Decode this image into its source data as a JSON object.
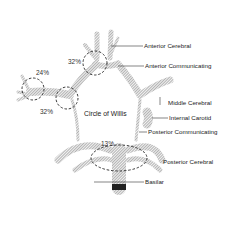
{
  "diagram": {
    "title": "Circle of Willis",
    "labels": [
      {
        "id": "anterior-cerebral",
        "text": "Anterior Cerebral"
      },
      {
        "id": "anterior-communicating",
        "text": "Anterior Communicating"
      },
      {
        "id": "middle-cerebral",
        "text": "Middle Cerebral"
      },
      {
        "id": "internal-carotid",
        "text": "Internal Carotid"
      },
      {
        "id": "posterior-communicating",
        "text": "Posterior Communicating"
      },
      {
        "id": "posterior-cerebral",
        "text": "Posterior Cerebral"
      },
      {
        "id": "basilar",
        "text": "Basilar"
      }
    ],
    "percentages": [
      {
        "id": "pct-anterior",
        "text": "32%"
      },
      {
        "id": "pct-middle-cerebral",
        "text": "24%"
      },
      {
        "id": "pct-carotid",
        "text": "32%"
      },
      {
        "id": "pct-basilar",
        "text": "13%"
      }
    ]
  }
}
